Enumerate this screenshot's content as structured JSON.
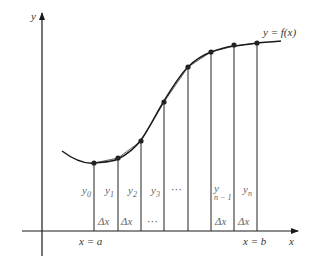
{
  "diagram": {
    "axes": {
      "x_label": "x",
      "y_label": "y"
    },
    "curve_label": "y = f(x)",
    "bounds": {
      "left_label": "x = a",
      "right_label": "x = b"
    },
    "ordinates": [
      {
        "base": "y",
        "sub": "0"
      },
      {
        "base": "y",
        "sub": "1"
      },
      {
        "base": "y",
        "sub": "2"
      },
      {
        "base": "y",
        "sub": "3"
      },
      {
        "base": "⋯",
        "sub": ""
      },
      {
        "base": "y",
        "sub": "n − 1"
      },
      {
        "base": "y",
        "sub": "n"
      }
    ],
    "widths": [
      "Δx",
      "Δx",
      "⋯",
      "Δx",
      "Δx"
    ],
    "colors": {
      "line": "#1a1a1a",
      "text": "#333333",
      "muted_text": "#666666"
    }
  }
}
